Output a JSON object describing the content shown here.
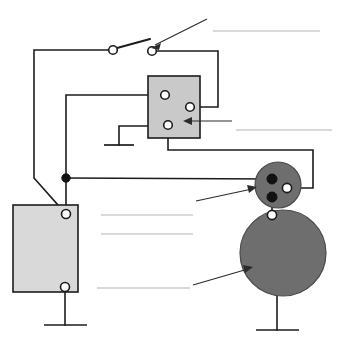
{
  "diagram": {
    "type": "automotive-starting-circuit",
    "canvas": {
      "width": 346,
      "height": 346
    },
    "colors": {
      "wire": "#1c1c1c",
      "battery_fill": "#d9d9d9",
      "relay_fill": "#c9c9c9",
      "solenoid_fill": "#6e6e6e",
      "motor_fill": "#6e6e6e",
      "terminal_open_fill": "#ffffff",
      "terminal_filled_fill": "#111111",
      "answer_rule": "#b4b4b4",
      "leader": "#2b2b2b",
      "background": "#ffffff"
    },
    "components": [
      {
        "id": "ignition-switch",
        "name": "ignition-switch",
        "shape": "switch",
        "label": "",
        "terminals": [
          {
            "id": "switch-terminal-left",
            "type": "open",
            "cx": 113,
            "cy": 50
          },
          {
            "id": "switch-terminal-right",
            "type": "open",
            "cx": 152,
            "cy": 51
          }
        ],
        "lever": {
          "x1": 117,
          "y1": 48,
          "x2": 150,
          "y2": 39
        }
      },
      {
        "id": "relay",
        "name": "relay",
        "shape": "rectangle",
        "label": "",
        "fill": "#c9c9c9",
        "x": 148,
        "y": 76,
        "width": 52,
        "height": 62,
        "terminals": [
          {
            "id": "relay-terminal-upper-left",
            "type": "open",
            "cx": 165,
            "cy": 95
          },
          {
            "id": "relay-terminal-right",
            "type": "open",
            "cx": 190,
            "cy": 107
          },
          {
            "id": "relay-terminal-lower-left",
            "type": "open",
            "cx": 168,
            "cy": 125
          }
        ]
      },
      {
        "id": "battery",
        "name": "battery",
        "shape": "rectangle",
        "label": "",
        "fill": "#d9d9d9",
        "x": 13,
        "y": 205,
        "width": 65,
        "height": 87,
        "terminals": [
          {
            "id": "battery-terminal-positive",
            "type": "open",
            "cx": 66,
            "cy": 214
          },
          {
            "id": "battery-terminal-negative",
            "type": "open",
            "cx": 65,
            "cy": 287
          }
        ]
      },
      {
        "id": "solenoid",
        "name": "starter-solenoid",
        "shape": "circle",
        "label": "",
        "fill": "#6e6e6e",
        "cx": 278,
        "cy": 185,
        "r": 23,
        "terminals": [
          {
            "id": "solenoid-terminal-battery",
            "type": "filled",
            "cx": 272,
            "cy": 179
          },
          {
            "id": "solenoid-terminal-control",
            "type": "open",
            "cx": 287,
            "cy": 188
          },
          {
            "id": "solenoid-terminal-motor",
            "type": "filled",
            "cx": 272,
            "cy": 197
          }
        ]
      },
      {
        "id": "starter-motor",
        "name": "starter-motor",
        "shape": "circle",
        "label": "",
        "fill": "#6e6e6e",
        "cx": 283,
        "cy": 253,
        "r": 43,
        "terminals": [
          {
            "id": "motor-terminal-top",
            "type": "open",
            "cx": 272,
            "cy": 215
          }
        ]
      },
      {
        "id": "junction",
        "name": "wire-junction",
        "shape": "dot",
        "cx": 66,
        "cy": 178,
        "r": 4.2
      }
    ],
    "grounds": [
      {
        "id": "ground-relay",
        "name": "ground-symbol-relay",
        "x": 119,
        "y": 145
      },
      {
        "id": "ground-battery",
        "name": "ground-symbol-battery",
        "x": 65,
        "y": 325
      },
      {
        "id": "ground-motor",
        "name": "ground-symbol-motor",
        "x": 277,
        "y": 330
      }
    ],
    "answer_lines": [
      {
        "id": "answer-line-switch",
        "name": "answer-line-switch",
        "x1": 213,
        "y1": 31,
        "x2": 320,
        "y2": 31
      },
      {
        "id": "answer-line-relay",
        "name": "answer-line-relay",
        "x1": 236,
        "y1": 130,
        "x2": 332,
        "y2": 130
      },
      {
        "id": "answer-line-battery-1",
        "name": "answer-line-battery-upper",
        "x1": 101,
        "y1": 215,
        "x2": 193,
        "y2": 215
      },
      {
        "id": "answer-line-battery-2",
        "name": "answer-line-battery-lower",
        "x1": 101,
        "y1": 234,
        "x2": 193,
        "y2": 234
      },
      {
        "id": "answer-line-motor",
        "name": "answer-line-motor",
        "x1": 97,
        "y1": 288,
        "x2": 190,
        "y2": 288
      }
    ],
    "leaders": [
      {
        "id": "leader-switch",
        "name": "leader-line-switch",
        "from_x": 207,
        "from_y": 19,
        "to_x": 155,
        "to_y": 45
      },
      {
        "id": "leader-relay",
        "name": "leader-line-relay",
        "from_x": 232,
        "from_y": 121,
        "to_x": 185,
        "to_y": 121
      },
      {
        "id": "leader-solenoid",
        "name": "leader-line-solenoid",
        "from_x": 196,
        "from_y": 201,
        "to_x": 254,
        "to_y": 188
      },
      {
        "id": "leader-motor",
        "name": "leader-line-motor",
        "from_x": 193,
        "from_y": 285,
        "to_x": 250,
        "to_y": 268
      }
    ]
  }
}
